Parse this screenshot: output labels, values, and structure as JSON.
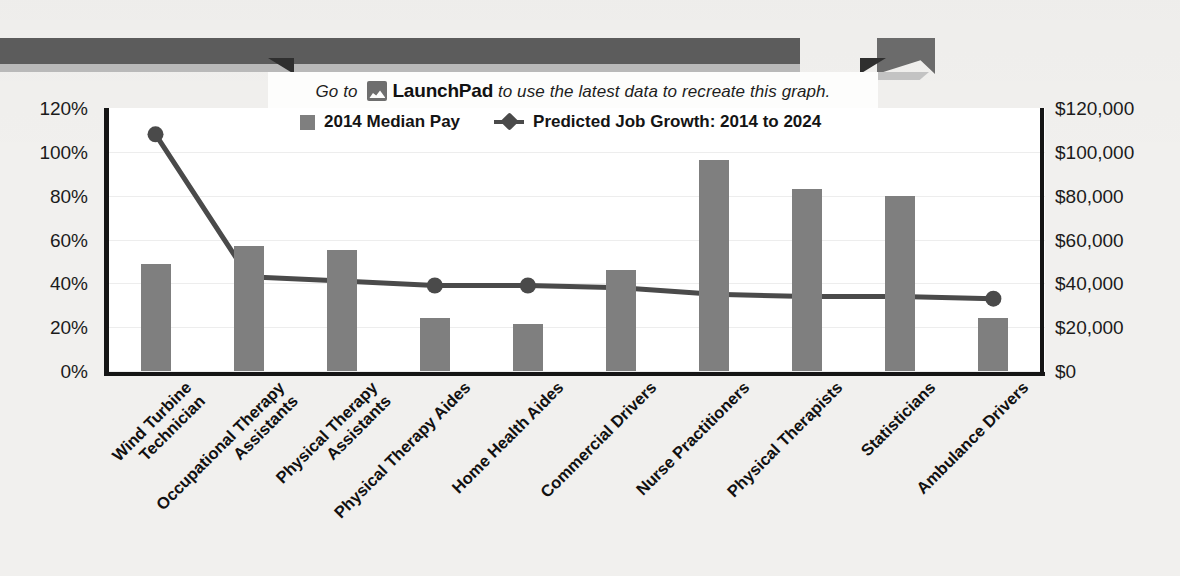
{
  "banner": {
    "prefix": "Go to",
    "icon": "launchpad-icon",
    "brand": "LaunchPad",
    "suffix": "to use the latest data to recreate this graph."
  },
  "legend": {
    "bar_label": "2014 Median Pay",
    "line_label": "Predicted Job Growth: 2014 to 2024",
    "bar_color": "#7f7f7f",
    "line_color": "#4a4a4a"
  },
  "axes": {
    "left_ticks": [
      "120%",
      "100%",
      "80%",
      "60%",
      "40%",
      "20%",
      "0%"
    ],
    "right_ticks": [
      "$120,000",
      "$100,000",
      "$80,000",
      "$60,000",
      "$40,000",
      "$20,000",
      "$0"
    ]
  },
  "chart_data": {
    "type": "bar",
    "title": "",
    "xlabel": "",
    "ylabel": "Predicted Job Growth: 2014 to 2024",
    "y2label": "2014 Median Pay",
    "ylim": [
      0,
      120
    ],
    "y2lim": [
      0,
      120000
    ],
    "grid": true,
    "legend_position": "top-center",
    "categories": [
      "Wind Turbine Technician",
      "Occupational Therapy Assistants",
      "Physical Therapy Assistants",
      "Physical Therapy Aides",
      "Home Health Aides",
      "Commercial Drivers",
      "Nurse Practitioners",
      "Physical Therapists",
      "Statisticians",
      "Ambulance Drivers"
    ],
    "category_lines": [
      [
        "Wind Turbine",
        "Technician"
      ],
      [
        "Occupational Therapy",
        "Assistants"
      ],
      [
        "Physical Therapy",
        "Assistants"
      ],
      [
        "Physical Therapy Aides"
      ],
      [
        "Home Health Aides"
      ],
      [
        "Commercial Drivers"
      ],
      [
        "Nurse Practitioners"
      ],
      [
        "Physical Therapists"
      ],
      [
        "Statisticians"
      ],
      [
        "Ambulance Drivers"
      ]
    ],
    "series": [
      {
        "name": "2014 Median Pay",
        "axis": "right",
        "type": "bar",
        "unit": "USD",
        "values": [
          48800,
          57000,
          55000,
          24000,
          21500,
          46000,
          96500,
          83000,
          80000,
          24000
        ]
      },
      {
        "name": "Predicted Job Growth: 2014 to 2024",
        "axis": "left",
        "type": "line",
        "unit": "percent",
        "values": [
          108,
          43,
          41,
          39,
          39,
          38,
          35,
          34,
          34,
          33
        ]
      }
    ]
  }
}
